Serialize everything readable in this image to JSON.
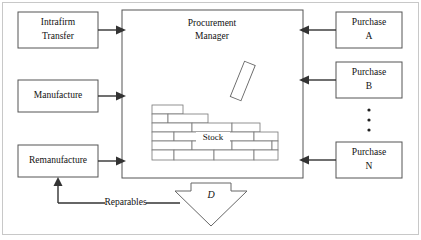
{
  "figure": {
    "center_box": {
      "label_line1": "Procurement",
      "label_line2": "Manager"
    },
    "stock": {
      "label": "Stock"
    },
    "demand": {
      "label": "D"
    },
    "inputs_left": [
      {
        "id": "intrafirm-transfer",
        "line1": "Intrafirm",
        "line2": "Transfer"
      },
      {
        "id": "manufacture",
        "line1": "Manufacture",
        "line2": ""
      },
      {
        "id": "remanufacture",
        "line1": "Remanufacture",
        "line2": ""
      }
    ],
    "inputs_right": [
      {
        "id": "purchase-a",
        "line1": "Purchase",
        "line2": "A"
      },
      {
        "id": "purchase-b",
        "line1": "Purchase",
        "line2": "B"
      },
      {
        "id": "purchase-n",
        "line1": "Purchase",
        "line2": "N"
      }
    ],
    "ellipsis": {
      "label": "vertical-ellipsis",
      "count": 3
    },
    "feedback_edge": {
      "label": "Reparables"
    },
    "colors": {
      "background": "#ffffff",
      "box_stroke": "#555555",
      "brick_stroke": "#777777",
      "arrow": "#333333",
      "frame": "#c8c8c8",
      "text": "#111111"
    }
  }
}
